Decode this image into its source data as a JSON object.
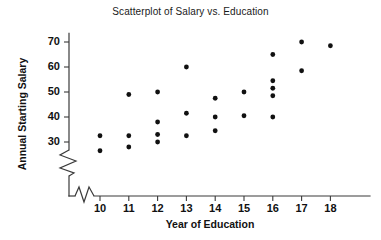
{
  "chart": {
    "title": "Scatterplot of Salary vs. Education",
    "xlabel": "Year of Education",
    "ylabel": "Annual Starting Salary"
  },
  "axes": {
    "y_ticks": [
      "30",
      "40",
      "50",
      "60",
      "70"
    ],
    "x_ticks": [
      "10",
      "11",
      "12",
      "13",
      "14",
      "15",
      "16",
      "17",
      "18"
    ],
    "axis_color": "#3a3a3a",
    "point_color": "#111111",
    "has_y_axis_break": true,
    "has_x_axis_break": true
  },
  "chart_data": {
    "type": "scatter",
    "title": "Scatterplot of Salary vs. Education",
    "xlabel": "Year of Education",
    "ylabel": "Annual Starting Salary",
    "xlim": [
      9.2,
      18.8
    ],
    "ylim": [
      26,
      73
    ],
    "xticks": [
      10,
      11,
      12,
      13,
      14,
      15,
      16,
      17,
      18
    ],
    "yticks": [
      30,
      40,
      50,
      60,
      70
    ],
    "grid": false,
    "legend": "none",
    "axis_break_y_below": 30,
    "points": [
      {
        "x": 10,
        "y": 32.5
      },
      {
        "x": 10,
        "y": 26.5
      },
      {
        "x": 11,
        "y": 49.0
      },
      {
        "x": 11,
        "y": 32.5
      },
      {
        "x": 11,
        "y": 28.0
      },
      {
        "x": 12,
        "y": 50.0
      },
      {
        "x": 12,
        "y": 38.0
      },
      {
        "x": 12,
        "y": 33.0
      },
      {
        "x": 12,
        "y": 30.0
      },
      {
        "x": 13,
        "y": 60.0
      },
      {
        "x": 13,
        "y": 41.5
      },
      {
        "x": 13,
        "y": 32.5
      },
      {
        "x": 14,
        "y": 47.5
      },
      {
        "x": 14,
        "y": 40.0
      },
      {
        "x": 14,
        "y": 34.5
      },
      {
        "x": 15,
        "y": 50.0
      },
      {
        "x": 15,
        "y": 40.5
      },
      {
        "x": 16,
        "y": 65.0
      },
      {
        "x": 16,
        "y": 54.5
      },
      {
        "x": 16,
        "y": 51.5
      },
      {
        "x": 16,
        "y": 48.5
      },
      {
        "x": 16,
        "y": 40.0
      },
      {
        "x": 17,
        "y": 70.0
      },
      {
        "x": 17,
        "y": 58.5
      },
      {
        "x": 18,
        "y": 68.5
      }
    ]
  }
}
